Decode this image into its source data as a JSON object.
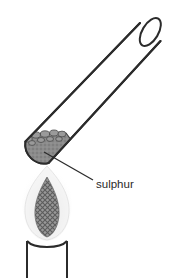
{
  "figure": {
    "annotations": [
      {
        "id": "sulphur",
        "label": "sulphur",
        "label_x": 96,
        "label_y": 185,
        "leader_from_x": 44,
        "leader_from_y": 152,
        "leader_to_x": 93,
        "leader_to_y": 180
      }
    ],
    "objects": [
      {
        "name": "test-tube",
        "description": "inclined test tube with rounded closed end at lower left and open mouth at upper right"
      },
      {
        "name": "sulphur-solid",
        "description": "granular grey solid resting in the rounded end of the test tube"
      },
      {
        "name": "burner-flame",
        "description": "pale outer flame envelope with darker cross-hatched inner cone"
      },
      {
        "name": "bunsen-burner",
        "description": "vertical burner barrel with curved rim below the flame"
      }
    ],
    "colors": {
      "outline": "#2b2b2b",
      "sulphur_fill": "#8b8b8b",
      "sulphur_edge": "#3a3a3a",
      "flame_outer": "#efefef",
      "flame_inner": "#8d8d8d",
      "background": "#ffffff",
      "label_text": "#2a2a2a"
    }
  }
}
